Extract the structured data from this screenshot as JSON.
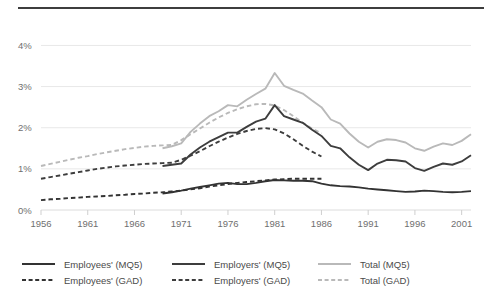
{
  "figure": {
    "caption_fragment": "",
    "background": "#ffffff"
  },
  "axes": {
    "y_ticks": [
      "0%",
      "1%",
      "2%",
      "3%",
      "4%"
    ],
    "x_ticks": [
      "1956",
      "1961",
      "1966",
      "1971",
      "1976",
      "1981",
      "1986",
      "1991",
      "1996",
      "2001"
    ]
  },
  "colors": {
    "dark": "#333333",
    "mid": "#3d3d3d",
    "light": "#b9b9b9",
    "grid": "#e8e8e8",
    "text": "#6f6f6f",
    "rule": "#3d3d3d"
  },
  "legend": {
    "items": [
      {
        "label": "Employees' (MQ5)",
        "style": "solid",
        "color": "#333333",
        "col": 0,
        "row": 0
      },
      {
        "label": "Employees' (GAD)",
        "style": "dashed",
        "color": "#333333",
        "col": 0,
        "row": 1
      },
      {
        "label": "Employers' (MQ5)",
        "style": "solid",
        "color": "#3d3d3d",
        "col": 1,
        "row": 0
      },
      {
        "label": "Employers' (GAD)",
        "style": "dashed",
        "color": "#3d3d3d",
        "col": 1,
        "row": 1
      },
      {
        "label": "Total  (MQ5)",
        "style": "solid",
        "color": "#b9b9b9",
        "col": 2,
        "row": 0
      },
      {
        "label": "Total (GAD)",
        "style": "dashed",
        "color": "#b9b9b9",
        "col": 2,
        "row": 1
      }
    ]
  },
  "chart_data": {
    "type": "line",
    "title": "",
    "xlabel": "",
    "ylabel": "",
    "xlim": [
      1956,
      2002
    ],
    "ylim": [
      0,
      4.4
    ],
    "ytick_values": [
      0,
      1,
      2,
      3,
      4
    ],
    "ytick_labels": [
      "0%",
      "1%",
      "2%",
      "3%",
      "4%"
    ],
    "xtick_values": [
      1956,
      1961,
      1966,
      1971,
      1976,
      1981,
      1986,
      1991,
      1996,
      2001
    ],
    "grid": "horizontal",
    "legend_position": "below",
    "units": "percent of GDP",
    "series": [
      {
        "name": "Employees' (GAD)",
        "style": "dashed",
        "color": "#333333",
        "x": [
          1956,
          1957,
          1958,
          1959,
          1960,
          1961,
          1962,
          1963,
          1964,
          1965,
          1966,
          1967,
          1968,
          1969,
          1970,
          1971,
          1972,
          1973,
          1974,
          1975,
          1976,
          1977,
          1978,
          1979,
          1980,
          1981,
          1982,
          1983,
          1984,
          1985,
          1986
        ],
        "y": [
          0.24,
          0.26,
          0.27,
          0.29,
          0.3,
          0.32,
          0.33,
          0.34,
          0.36,
          0.37,
          0.39,
          0.4,
          0.42,
          0.43,
          0.45,
          0.47,
          0.5,
          0.53,
          0.57,
          0.6,
          0.63,
          0.66,
          0.68,
          0.7,
          0.72,
          0.74,
          0.75,
          0.76,
          0.76,
          0.76,
          0.76
        ]
      },
      {
        "name": "Employers' (GAD)",
        "style": "dashed",
        "color": "#3d3d3d",
        "x": [
          1956,
          1957,
          1958,
          1959,
          1960,
          1961,
          1962,
          1963,
          1964,
          1965,
          1966,
          1967,
          1968,
          1969,
          1970,
          1971,
          1972,
          1973,
          1974,
          1975,
          1976,
          1977,
          1978,
          1979,
          1980,
          1981,
          1982,
          1983,
          1984,
          1985,
          1986
        ],
        "y": [
          0.76,
          0.8,
          0.84,
          0.88,
          0.92,
          0.96,
          1.0,
          1.03,
          1.06,
          1.08,
          1.1,
          1.12,
          1.13,
          1.14,
          1.15,
          1.22,
          1.32,
          1.43,
          1.55,
          1.66,
          1.76,
          1.85,
          1.92,
          1.97,
          1.99,
          1.96,
          1.86,
          1.72,
          1.56,
          1.42,
          1.3
        ]
      },
      {
        "name": "Total (GAD)",
        "style": "dashed",
        "color": "#b9b9b9",
        "x": [
          1956,
          1957,
          1958,
          1959,
          1960,
          1961,
          1962,
          1963,
          1964,
          1965,
          1966,
          1967,
          1968,
          1969,
          1970,
          1971,
          1972,
          1973,
          1974,
          1975,
          1976,
          1977,
          1978,
          1979,
          1980,
          1981,
          1982,
          1983,
          1984,
          1985,
          1986
        ],
        "y": [
          1.07,
          1.12,
          1.17,
          1.22,
          1.27,
          1.31,
          1.36,
          1.4,
          1.44,
          1.48,
          1.51,
          1.54,
          1.56,
          1.57,
          1.58,
          1.7,
          1.84,
          1.98,
          2.12,
          2.25,
          2.36,
          2.45,
          2.52,
          2.57,
          2.58,
          2.54,
          2.43,
          2.28,
          2.12,
          1.98,
          1.86
        ]
      },
      {
        "name": "Employees' (MQ5)",
        "style": "solid",
        "color": "#333333",
        "x": [
          1969,
          1970,
          1971,
          1972,
          1973,
          1974,
          1975,
          1976,
          1977,
          1978,
          1979,
          1980,
          1981,
          1982,
          1983,
          1984,
          1985,
          1986,
          1987,
          1988,
          1989,
          1990,
          1991,
          1992,
          1993,
          1994,
          1995,
          1996,
          1997,
          1998,
          1999,
          2000,
          2001,
          2002
        ],
        "y": [
          0.4,
          0.43,
          0.47,
          0.52,
          0.56,
          0.6,
          0.64,
          0.66,
          0.63,
          0.63,
          0.66,
          0.7,
          0.73,
          0.72,
          0.71,
          0.71,
          0.7,
          0.64,
          0.6,
          0.58,
          0.57,
          0.55,
          0.52,
          0.5,
          0.48,
          0.46,
          0.44,
          0.45,
          0.47,
          0.46,
          0.44,
          0.43,
          0.44,
          0.46
        ]
      },
      {
        "name": "Employers' (MQ5)",
        "style": "solid",
        "color": "#3d3d3d",
        "x": [
          1969,
          1970,
          1971,
          1972,
          1973,
          1974,
          1975,
          1976,
          1977,
          1978,
          1979,
          1980,
          1981,
          1982,
          1983,
          1984,
          1985,
          1986,
          1987,
          1988,
          1989,
          1990,
          1991,
          1992,
          1993,
          1994,
          1995,
          1996,
          1997,
          1998,
          1999,
          2000,
          2001,
          2002
        ],
        "y": [
          1.07,
          1.1,
          1.13,
          1.35,
          1.52,
          1.66,
          1.77,
          1.88,
          1.88,
          2.02,
          2.15,
          2.22,
          2.55,
          2.28,
          2.2,
          2.12,
          1.95,
          1.8,
          1.56,
          1.5,
          1.28,
          1.1,
          0.97,
          1.13,
          1.22,
          1.21,
          1.18,
          1.02,
          0.95,
          1.05,
          1.13,
          1.1,
          1.18,
          1.33
        ]
      },
      {
        "name": "Total (MQ5)",
        "style": "solid",
        "color": "#b9b9b9",
        "x": [
          1969,
          1970,
          1971,
          1972,
          1973,
          1974,
          1975,
          1976,
          1977,
          1978,
          1979,
          1980,
          1981,
          1982,
          1983,
          1984,
          1985,
          1986,
          1987,
          1988,
          1989,
          1990,
          1991,
          1992,
          1993,
          1994,
          1995,
          1996,
          1997,
          1998,
          1999,
          2000,
          2001,
          2002
        ],
        "y": [
          1.5,
          1.55,
          1.62,
          1.9,
          2.1,
          2.28,
          2.4,
          2.55,
          2.52,
          2.68,
          2.82,
          2.95,
          3.33,
          3.02,
          2.92,
          2.83,
          2.66,
          2.5,
          2.2,
          2.1,
          1.86,
          1.66,
          1.52,
          1.66,
          1.72,
          1.7,
          1.64,
          1.5,
          1.44,
          1.54,
          1.62,
          1.58,
          1.68,
          1.84
        ]
      }
    ]
  }
}
